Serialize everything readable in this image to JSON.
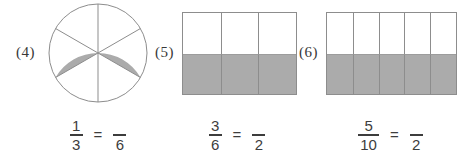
{
  "page": {
    "background": "#ffffff"
  },
  "colors": {
    "shade": "#ababab",
    "outline": "#8d8d8d",
    "grid_line": "#8d8d8d",
    "text": "#3d3d3d",
    "label_text": "#383838"
  },
  "problems": [
    {
      "label": "(4)",
      "model": {
        "type": "circle",
        "total_parts": 6,
        "shaded_parts": 2,
        "first_divider_angle_deg": 90,
        "shaded_start_angle_deg": 210
      },
      "equation": {
        "lhs_numerator": "1",
        "lhs_denominator": "3",
        "equals": "=",
        "rhs_numerator": "",
        "rhs_denominator": "6"
      }
    },
    {
      "label": "(5)",
      "model": {
        "type": "grid",
        "columns": 3,
        "rows": 2,
        "shaded_row": "bottom",
        "shaded_parts": 3,
        "total_parts": 6
      },
      "equation": {
        "lhs_numerator": "3",
        "lhs_denominator": "6",
        "equals": "=",
        "rhs_numerator": "",
        "rhs_denominator": "2"
      }
    },
    {
      "label": "(6)",
      "model": {
        "type": "grid",
        "columns": 5,
        "rows": 2,
        "shaded_row": "bottom",
        "shaded_parts": 5,
        "total_parts": 10
      },
      "equation": {
        "lhs_numerator": "5",
        "lhs_denominator": "10",
        "equals": "=",
        "rhs_numerator": "",
        "rhs_denominator": "2"
      }
    }
  ]
}
